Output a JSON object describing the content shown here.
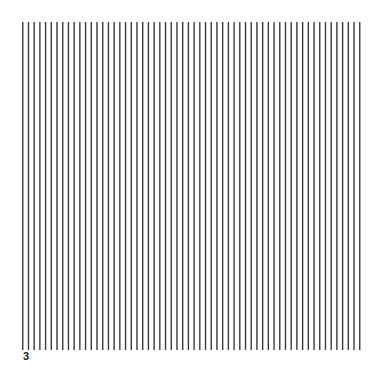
{
  "figure": {
    "label": "3",
    "pattern": {
      "type": "vertical-line-grating",
      "line_count": 60,
      "line_color": "#3a3a3a",
      "background": "#ffffff"
    }
  }
}
